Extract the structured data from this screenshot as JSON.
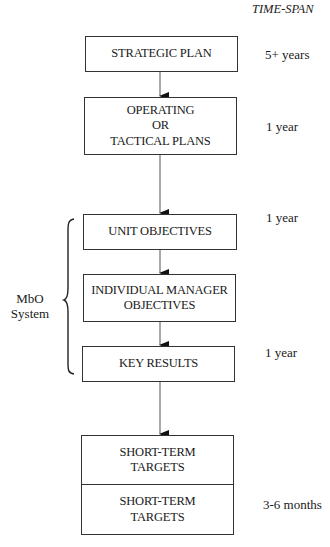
{
  "header": {
    "time_span_label": "TIME-SPAN"
  },
  "boxes": [
    {
      "id": "strategic-plan",
      "lines": [
        "STRATEGIC PLAN"
      ],
      "time_span": "5+ years"
    },
    {
      "id": "operating-tactical-plans",
      "lines": [
        "OPERATING",
        "OR",
        "TACTICAL PLANS"
      ],
      "time_span": "1 year"
    },
    {
      "id": "unit-objectives",
      "lines": [
        "UNIT OBJECTIVES"
      ],
      "time_span": "1 year"
    },
    {
      "id": "individual-manager-objectives",
      "lines": [
        "INDIVIDUAL MANAGER",
        "OBJECTIVES"
      ],
      "time_span": ""
    },
    {
      "id": "key-results",
      "lines": [
        "KEY RESULTS"
      ],
      "time_span": "1 year"
    },
    {
      "id": "short-term-targets",
      "sections": [
        {
          "lines": [
            "SHORT-TERM",
            "TARGETS"
          ]
        },
        {
          "lines": [
            "SHORT-TERM",
            "TARGETS"
          ]
        }
      ],
      "time_span": "3-6 months"
    }
  ],
  "bracket": {
    "label_lines": [
      "MbO",
      "System"
    ],
    "spans": [
      "unit-objectives",
      "individual-manager-objectives",
      "key-results"
    ]
  },
  "colors": {
    "line": "#333333",
    "text": "#1a1a1a",
    "background": "#ffffff"
  }
}
